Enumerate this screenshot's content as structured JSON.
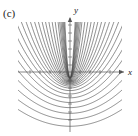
{
  "figure": {
    "panel_label": "(c)",
    "background_color": "#ffffff",
    "curve_color": "#333333",
    "axis_color": "#555555",
    "width": 138,
    "height": 136
  },
  "axes": {
    "x_label": "x",
    "y_label": "y",
    "x_axis_y_pixel": 72,
    "y_axis_x_pixel": 70,
    "x_tick_positions": [
      30,
      40,
      50,
      60,
      80,
      90,
      100,
      110
    ],
    "y_tick_positions": [
      25,
      33,
      41,
      49,
      57,
      65,
      80,
      88,
      96,
      104,
      112,
      120
    ],
    "x_arrow": true,
    "y_arrow": true,
    "grid": false
  },
  "chart_data": {
    "type": "line",
    "title": "",
    "subtitle": "",
    "xlabel": "x",
    "ylabel": "y",
    "xlim": [
      -2.6,
      2.6
    ],
    "ylim": [
      -2.4,
      2.4
    ],
    "grid": false,
    "legend_position": "none",
    "series": [
      {
        "name": "p01",
        "a": 11.0,
        "c": -0.28,
        "values": []
      },
      {
        "name": "p02",
        "a": 7.2,
        "c": -0.3,
        "values": []
      },
      {
        "name": "p03",
        "a": 5.0,
        "c": -0.32,
        "values": []
      },
      {
        "name": "p04",
        "a": 3.6,
        "c": -0.34,
        "values": []
      },
      {
        "name": "p05",
        "a": 2.7,
        "c": -0.36,
        "values": []
      },
      {
        "name": "p06",
        "a": 2.1,
        "c": -0.38,
        "values": []
      },
      {
        "name": "p07",
        "a": 1.65,
        "c": -0.4,
        "values": []
      },
      {
        "name": "p08",
        "a": 1.33,
        "c": -0.43,
        "values": []
      },
      {
        "name": "p09",
        "a": 1.08,
        "c": -0.46,
        "values": []
      },
      {
        "name": "p10",
        "a": 0.89,
        "c": -0.5,
        "values": []
      },
      {
        "name": "p11",
        "a": 0.74,
        "c": -0.55,
        "values": []
      },
      {
        "name": "p12",
        "a": 0.62,
        "c": -0.62,
        "values": []
      },
      {
        "name": "p13",
        "a": 0.52,
        "c": -0.72,
        "values": []
      },
      {
        "name": "p14",
        "a": 0.44,
        "c": -0.85,
        "values": []
      },
      {
        "name": "p15",
        "a": 0.375,
        "c": -1.0,
        "values": []
      },
      {
        "name": "p16",
        "a": 0.32,
        "c": -1.18,
        "values": []
      },
      {
        "name": "p17",
        "a": 0.275,
        "c": -1.38,
        "values": []
      },
      {
        "name": "p18",
        "a": 0.235,
        "c": -1.6,
        "values": []
      },
      {
        "name": "p19",
        "a": 0.2,
        "c": -1.84,
        "values": []
      },
      {
        "name": "p20",
        "a": 0.17,
        "c": -2.1,
        "values": []
      },
      {
        "name": "p21",
        "a": 14.5,
        "c": -0.26,
        "values": []
      },
      {
        "name": "p22",
        "a": 19.0,
        "c": -0.25,
        "values": []
      },
      {
        "name": "p23",
        "a": 25.0,
        "c": -0.24,
        "values": []
      },
      {
        "name": "p24",
        "a": 33.0,
        "c": -0.23,
        "values": []
      },
      {
        "name": "p25",
        "a": 44.0,
        "c": -0.225,
        "values": []
      },
      {
        "name": "p26",
        "a": 58.0,
        "c": -0.22,
        "values": []
      }
    ]
  }
}
